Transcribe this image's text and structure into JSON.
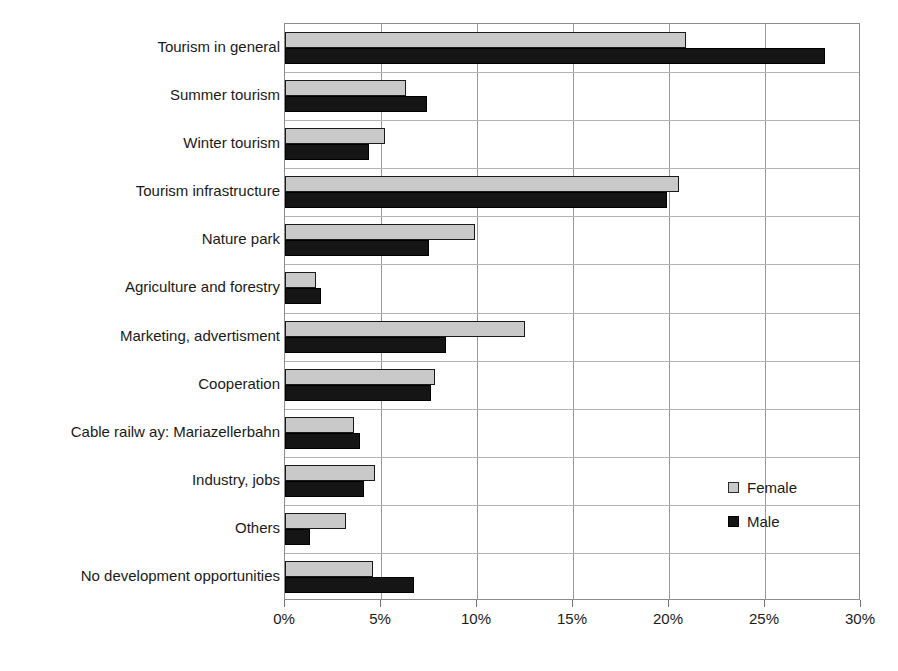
{
  "chart_data": {
    "type": "bar",
    "orientation": "horizontal",
    "title": "",
    "subtitle": "",
    "xlabel": "",
    "ylabel": "",
    "xlim": [
      0,
      30
    ],
    "xunit": "%",
    "xtick_labels": [
      "0%",
      "5%",
      "10%",
      "15%",
      "20%",
      "25%",
      "30%"
    ],
    "xtick_values": [
      0,
      5,
      10,
      15,
      20,
      25,
      30
    ],
    "grid": true,
    "legend_position": "center-right",
    "categories": [
      "Tourism in general",
      "Summer tourism",
      "Winter tourism",
      "Tourism infrastructure",
      "Nature park",
      "Agriculture and forestry",
      "Marketing, advertisment",
      "Cooperation",
      "Cable railw ay: Mariazellerbahn",
      "Industry, jobs",
      "Others",
      "No development opportunities"
    ],
    "series": [
      {
        "name": "Female",
        "color": "#c9c9c9",
        "values": [
          20.9,
          6.3,
          5.2,
          20.5,
          9.9,
          1.6,
          12.5,
          7.8,
          3.6,
          4.7,
          3.2,
          4.6
        ]
      },
      {
        "name": "Male",
        "color": "#151515",
        "values": [
          28.1,
          7.4,
          4.4,
          19.9,
          7.5,
          1.9,
          8.4,
          7.6,
          3.9,
          4.1,
          1.3,
          6.7
        ]
      }
    ]
  },
  "legend": {
    "items": [
      {
        "label": "Female",
        "swatch": "legend-swatch-female"
      },
      {
        "label": "Male",
        "swatch": "legend-swatch-male"
      }
    ]
  },
  "colors": {
    "female": "#c9c9c9",
    "male": "#151515",
    "gridline": "#9a9a9a",
    "axis": "#8c8c8c",
    "text": "#1a1a1a",
    "background": "#ffffff"
  }
}
